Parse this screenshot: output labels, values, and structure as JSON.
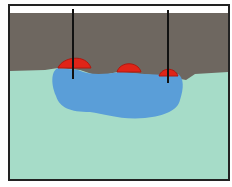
{
  "diagram": {
    "colors": {
      "soil": "#6e6760",
      "groundwater": "#a6dcc8",
      "plume": "#5a9ed8",
      "product": "#e02418",
      "product_edge": "#b01810",
      "well": "#111111",
      "frame": "#222222",
      "sky": "#ffffff"
    },
    "labels": []
  }
}
